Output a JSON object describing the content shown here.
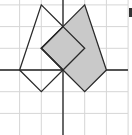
{
  "diagram": {
    "type": "coordinate-grid-reflection",
    "grid": {
      "origin_px": [
        63,
        70
      ],
      "unit_px": 21.7,
      "x_range": [
        -3,
        3
      ],
      "y_range": [
        -3,
        3
      ]
    },
    "colors": {
      "grid": "#d6d6d6",
      "axis": "#222222",
      "outline": "#2a2a2a",
      "shade": "#c9c9c9"
    },
    "unshaded_figure": {
      "vertices": [
        [
          -1,
          3
        ],
        [
          0,
          2
        ],
        [
          -1,
          1
        ],
        [
          0,
          0
        ],
        [
          -1,
          -1
        ],
        [
          -2,
          0
        ]
      ]
    },
    "shaded_figure": {
      "vertices": [
        [
          0,
          2
        ],
        [
          1,
          3
        ],
        [
          2,
          0
        ],
        [
          1,
          -1
        ],
        [
          0,
          0
        ],
        [
          -1,
          1
        ]
      ]
    },
    "inner_diamond": {
      "vertices": [
        [
          0,
          2
        ],
        [
          1,
          1
        ],
        [
          0,
          0
        ],
        [
          -1,
          1
        ]
      ]
    }
  }
}
